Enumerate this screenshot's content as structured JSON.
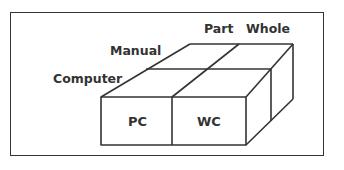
{
  "diagram": {
    "axis_labels": {
      "part": "Part",
      "whole": "Whole",
      "manual": "Manual",
      "computer": "Computer"
    },
    "cells": {
      "pc": "PC",
      "wc": "WC"
    },
    "colors": {
      "stroke": "#333333",
      "background": "#ffffff"
    }
  }
}
